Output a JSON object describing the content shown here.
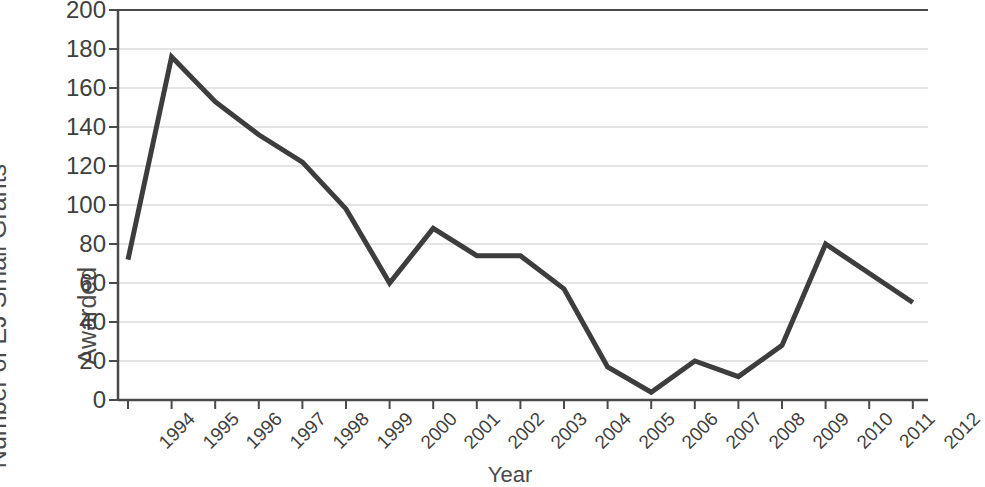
{
  "chart_data": {
    "type": "line",
    "title": "",
    "xlabel": "Year",
    "ylabel": "Number of EJ Small Grants Awarded",
    "ylabel_lines": [
      "Number of EJ Small Grants",
      "Awarded"
    ],
    "categories": [
      "1994",
      "1995",
      "1996",
      "1997",
      "1998",
      "1999",
      "2000",
      "2001",
      "2002",
      "2003",
      "2004",
      "2005",
      "2006",
      "2007",
      "2008",
      "2009",
      "2010",
      "2011",
      "2012"
    ],
    "values": [
      72,
      176,
      153,
      136,
      122,
      98,
      60,
      88,
      74,
      74,
      57,
      17,
      4,
      20,
      12,
      28,
      80,
      65,
      50
    ],
    "ylim": [
      0,
      200
    ],
    "y_ticks": [
      200,
      180,
      160,
      140,
      120,
      100,
      80,
      60,
      40,
      20,
      0
    ],
    "y_tick_labels": [
      "200",
      "180",
      "160",
      "140",
      "120",
      "100",
      "80",
      "60",
      "40",
      "20",
      "0"
    ],
    "grid": true,
    "grid_axis": "y",
    "legend": false,
    "legend_position": "none",
    "series": [
      {
        "name": "Number of EJ Small Grants Awarded",
        "color": "#3d3d3d",
        "values": [
          72,
          176,
          153,
          136,
          122,
          98,
          60,
          88,
          74,
          74,
          57,
          17,
          4,
          20,
          12,
          28,
          80,
          65,
          50
        ]
      }
    ]
  },
  "colors": {
    "line": "#3d3d3d",
    "axis": "#4a4a4a",
    "grid": "#c9c9c9",
    "text": "#3f3f3f",
    "background": "#ffffff"
  }
}
